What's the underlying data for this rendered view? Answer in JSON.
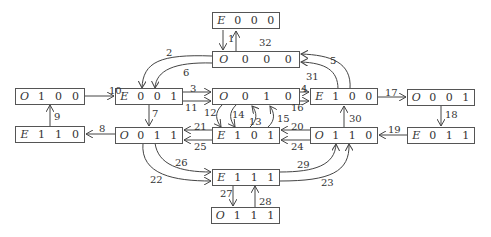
{
  "nodes": {
    "E000": {
      "state": "E",
      "bits": [
        "0",
        "0",
        "0"
      ]
    },
    "O000": {
      "state": "O",
      "bits": [
        "0",
        "0",
        "0"
      ]
    },
    "O100": {
      "state": "O",
      "bits": [
        "1",
        "0",
        "0"
      ]
    },
    "E001": {
      "state": "E",
      "bits": [
        "0",
        "0",
        "1"
      ]
    },
    "O010": {
      "state": "O",
      "bits": [
        "0",
        "1",
        "0"
      ]
    },
    "E100": {
      "state": "E",
      "bits": [
        "1",
        "0",
        "0"
      ]
    },
    "O001": {
      "state": "O",
      "bits": [
        "0",
        "0",
        "1"
      ]
    },
    "E110": {
      "state": "E",
      "bits": [
        "1",
        "1",
        "0"
      ]
    },
    "O011": {
      "state": "O",
      "bits": [
        "0",
        "1",
        "1"
      ]
    },
    "E101": {
      "state": "E",
      "bits": [
        "1",
        "0",
        "1"
      ]
    },
    "O110": {
      "state": "O",
      "bits": [
        "1",
        "1",
        "0"
      ]
    },
    "E011": {
      "state": "E",
      "bits": [
        "0",
        "1",
        "1"
      ]
    },
    "E111": {
      "state": "E",
      "bits": [
        "1",
        "1",
        "1"
      ]
    },
    "O111": {
      "state": "O",
      "bits": [
        "1",
        "1",
        "1"
      ]
    }
  },
  "edges": {
    "e1": "1",
    "e2": "2",
    "e3": "3",
    "e4": "4",
    "e5": "5",
    "e6": "6",
    "e7": "7",
    "e8": "8",
    "e9": "9",
    "e10": "10",
    "e11": "11",
    "e12": "12",
    "e13": "13",
    "e14": "14",
    "e15": "15",
    "e16": "16",
    "e17": "17",
    "e18": "18",
    "e19": "19",
    "e20": "20",
    "e21": "21",
    "e22": "22",
    "e23": "23",
    "e24": "24",
    "e25": "25",
    "e26": "26",
    "e27": "27",
    "e28": "28",
    "e29": "29",
    "e30": "30",
    "e31": "31",
    "e32": "32"
  }
}
